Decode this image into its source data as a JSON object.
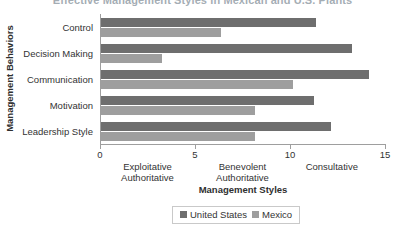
{
  "chart_data": {
    "type": "bar",
    "orientation": "horizontal",
    "title": "Effective Management Styles in Mexican and U.S. Plants",
    "xlabel": "Management Styles",
    "ylabel": "Management Behaviors",
    "categories": [
      "Control",
      "Decision Making",
      "Communication",
      "Motivation",
      "Leadership Style"
    ],
    "series": [
      {
        "name": "United States",
        "color": "#6e6e6e",
        "values": [
          11.3,
          13.2,
          14.1,
          11.2,
          12.1
        ]
      },
      {
        "name": "Mexico",
        "color": "#9e9e9e",
        "values": [
          6.3,
          3.2,
          10.1,
          8.1,
          8.1
        ]
      }
    ],
    "xlim": [
      0,
      15
    ],
    "xticks": [
      "0",
      "5",
      "10",
      "15"
    ],
    "xtick_values": [
      0,
      5,
      10,
      15
    ],
    "x_category_labels": [
      {
        "line1": "Exploitative",
        "line2": "Authoritative",
        "center": 2.5
      },
      {
        "line1": "Benevolent",
        "line2": "Authoritative",
        "center": 7.5
      },
      {
        "line1": "Consultative",
        "line2": "",
        "center": 12.2
      }
    ],
    "grid": false,
    "legend_position": "bottom"
  },
  "legend": {
    "items": [
      {
        "label": "United States",
        "color": "#6e6e6e"
      },
      {
        "label": "Mexico",
        "color": "#9e9e9e"
      }
    ]
  }
}
